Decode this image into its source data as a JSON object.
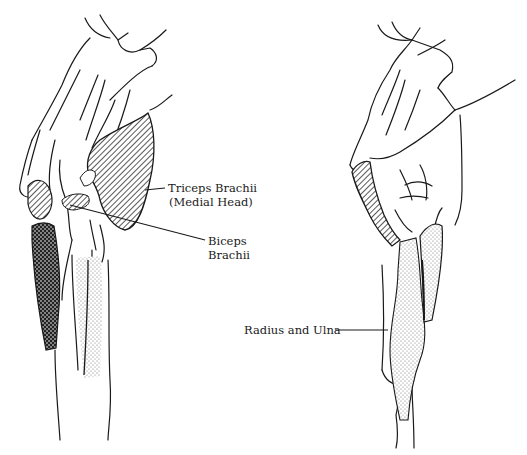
{
  "figure": {
    "type": "anatomical-illustration",
    "views": [
      {
        "id": "left-view",
        "description": "Lateral view of forelimb (shoulder and elbow region)"
      },
      {
        "id": "right-view",
        "description": "Medial view of forelimb"
      }
    ],
    "labels": {
      "triceps": {
        "line1": "Triceps Brachii",
        "line2": "(Medial Head)"
      },
      "biceps": {
        "line1": "Biceps",
        "line2": "Brachii"
      },
      "radius_ulna": {
        "line1": "Radius and Ulna"
      }
    },
    "patterns": {
      "hatched": "diagonal hatching (muscle region)",
      "checker": "dense checker (muscle region)",
      "stipple": "dot stipple (bone region)"
    },
    "colors": {
      "ink": "#1a1a1a",
      "paper": "#ffffff"
    }
  }
}
